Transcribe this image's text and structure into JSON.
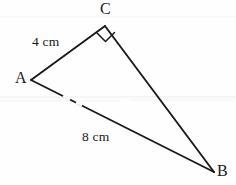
{
  "figure": {
    "kind": "right-triangle-diagram",
    "stroke_color": "#1a1a1a",
    "background_color": "#fefefe",
    "vertices": [
      {
        "name": "C",
        "label": "C",
        "x": 105,
        "y": 26
      },
      {
        "name": "A",
        "label": "A",
        "x": 31,
        "y": 80
      },
      {
        "name": "B",
        "label": "B",
        "x": 214,
        "y": 172
      }
    ],
    "sides": [
      {
        "name": "AC",
        "from": "A",
        "to": "C",
        "label": "4 cm",
        "value": 4,
        "unit": "cm"
      },
      {
        "name": "CB",
        "from": "C",
        "to": "B",
        "label": "",
        "value": null,
        "unit": ""
      },
      {
        "name": "AB",
        "from": "A",
        "to": "B",
        "label": "8 cm",
        "value": 8,
        "unit": "cm"
      }
    ],
    "angle_markers": [
      {
        "at": "C",
        "type": "right-angle",
        "symbol": "square",
        "degrees": 90
      }
    ]
  }
}
